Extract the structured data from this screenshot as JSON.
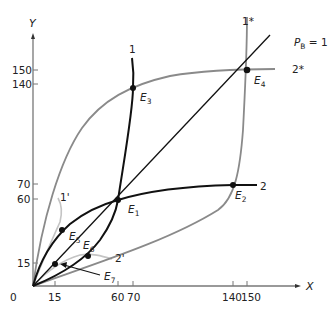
{
  "diagram": {
    "axes": {
      "x_label": "X",
      "y_label": "Y",
      "origin_label": "0",
      "x_ticks": [
        "15",
        "60",
        "70",
        "140",
        "150"
      ],
      "y_ticks": [
        "15",
        "60",
        "70",
        "140",
        "150"
      ]
    },
    "price_label": {
      "p": "P",
      "sub": "B",
      "rest": " = 1"
    },
    "curves": {
      "c1": "1",
      "c2": "2",
      "c1star": "1*",
      "c2star": "2*",
      "c1prime": "1'",
      "c2prime": "2'"
    },
    "points": {
      "e1": {
        "main": "E",
        "sub": "1"
      },
      "e2": {
        "main": "E",
        "sub": "2"
      },
      "e3": {
        "main": "E",
        "sub": "3"
      },
      "e4": {
        "main": "E",
        "sub": "4"
      },
      "e5": {
        "main": "E",
        "sub": "5"
      },
      "e6": {
        "main": "E",
        "sub": "6"
      },
      "e7": {
        "main": "E",
        "sub": "7"
      }
    },
    "colors": {
      "black_curve": "#111111",
      "gray_curve": "#8a8a8a",
      "light_curve": "#c4c4c4",
      "axis": "#777777"
    }
  }
}
